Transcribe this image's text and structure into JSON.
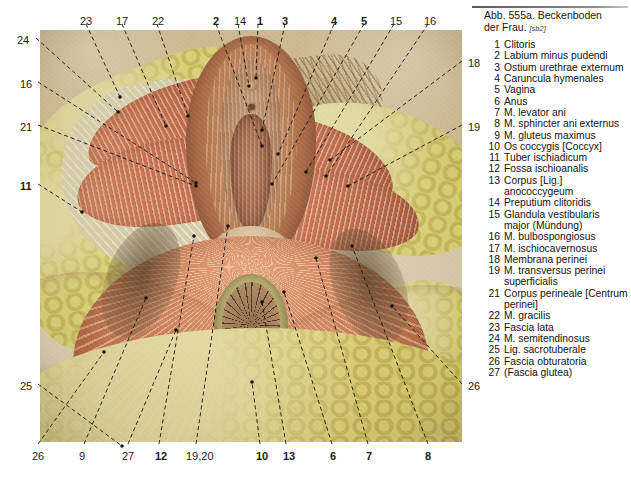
{
  "figure": {
    "title_line1": "Abb. 555a. Beckenboden",
    "title_line2": "der Frau.",
    "source": "[sb2]"
  },
  "legend": {
    "items": [
      {
        "num": "1",
        "label": "Clitoris"
      },
      {
        "num": "2",
        "label": "Labium minus pudendi"
      },
      {
        "num": "3",
        "label": "Ostium urethrae externum"
      },
      {
        "num": "4",
        "label": "Caruncula hymenales"
      },
      {
        "num": "5",
        "label": "Vagina"
      },
      {
        "num": "6",
        "label": "Anus"
      },
      {
        "num": "7",
        "label": "M. levator ani"
      },
      {
        "num": "8",
        "label": "M. sphincter ani externus"
      },
      {
        "num": "9",
        "label": "M. gluteus maximus"
      },
      {
        "num": "10",
        "label": "Os coccygis [Coccyx]"
      },
      {
        "num": "11",
        "label": "Tuber ischiadicum"
      },
      {
        "num": "12",
        "label": "Fossa ischioanalis"
      },
      {
        "num": "13",
        "label": "Corpus [Lig.] anococcygeum"
      },
      {
        "num": "14",
        "label": "Preputium clitoridis"
      },
      {
        "num": "15",
        "label": "Glandula vestibularis major (Mündung)"
      },
      {
        "num": "16",
        "label": "M. bulbospongiosus"
      },
      {
        "num": "17",
        "label": "M. ischiocavernosus"
      },
      {
        "num": "18",
        "label": "Membrana perinei"
      },
      {
        "num": "19",
        "label": "M. transversus perinei superficialis"
      },
      {
        "num": "21",
        "label": "Corpus perineale [Centrum perinei]"
      },
      {
        "num": "22",
        "label": "M. gracilis"
      },
      {
        "num": "23",
        "label": "Fascia lata"
      },
      {
        "num": "24",
        "label": "M. semitendinosus"
      },
      {
        "num": "25",
        "label": "Lig. sacrotuberale"
      },
      {
        "num": "26",
        "label": "Fascia obturatoria"
      },
      {
        "num": "27",
        "label": "(Fascia glutea)"
      }
    ]
  },
  "callouts": {
    "top": [
      {
        "text": "23",
        "bold": false,
        "x": 80,
        "y": 16
      },
      {
        "text": "17",
        "bold": false,
        "x": 116,
        "y": 16
      },
      {
        "text": "22",
        "bold": false,
        "x": 152,
        "y": 16
      },
      {
        "text": "2",
        "bold": true,
        "x": 213,
        "y": 16
      },
      {
        "text": "14",
        "bold": false,
        "x": 234,
        "y": 16
      },
      {
        "text": "1",
        "bold": true,
        "x": 257,
        "y": 16
      },
      {
        "text": "3",
        "bold": true,
        "x": 282,
        "y": 16
      },
      {
        "text": "4",
        "bold": true,
        "x": 331,
        "y": 16
      },
      {
        "text": "5",
        "bold": true,
        "x": 361,
        "y": 16
      },
      {
        "text": "15",
        "bold": false,
        "x": 390,
        "y": 16
      },
      {
        "text": "16",
        "bold": false,
        "x": 424,
        "y": 16
      }
    ],
    "bottom": [
      {
        "text": "26",
        "bold": false,
        "x": 32,
        "y": 451
      },
      {
        "text": "9",
        "bold": false,
        "x": 79,
        "y": 451
      },
      {
        "text": "27",
        "bold": false,
        "x": 122,
        "y": 451
      },
      {
        "text": "12",
        "bold": true,
        "x": 155,
        "y": 451
      },
      {
        "text": "19,20",
        "bold": false,
        "x": 186,
        "y": 451
      },
      {
        "text": "10",
        "bold": true,
        "x": 256,
        "y": 451
      },
      {
        "text": "13",
        "bold": true,
        "x": 283,
        "y": 451
      },
      {
        "text": "6",
        "bold": true,
        "x": 330,
        "y": 451
      },
      {
        "text": "7",
        "bold": true,
        "x": 366,
        "y": 451
      },
      {
        "text": "8",
        "bold": true,
        "x": 425,
        "y": 451
      }
    ],
    "left": [
      {
        "text": "24",
        "bold": false,
        "x": 17,
        "y": 35
      },
      {
        "text": "16",
        "bold": false,
        "x": 20,
        "y": 79
      },
      {
        "text": "21",
        "bold": false,
        "x": 20,
        "y": 122
      },
      {
        "text": "11",
        "bold": true,
        "x": 20,
        "y": 181
      },
      {
        "text": "25",
        "bold": false,
        "x": 20,
        "y": 381
      }
    ],
    "right": [
      {
        "text": "18",
        "bold": false,
        "x": 468,
        "y": 58
      },
      {
        "text": "19",
        "bold": false,
        "x": 468,
        "y": 122
      },
      {
        "text": "26",
        "bold": false,
        "x": 468,
        "y": 381
      }
    ]
  },
  "leader_lines": [
    {
      "name": "leader-24",
      "x1": 36,
      "y1": 38,
      "x2": 118,
      "y2": 112
    },
    {
      "name": "leader-16l",
      "x1": 38,
      "y1": 82,
      "x2": 196,
      "y2": 183
    },
    {
      "name": "leader-21",
      "x1": 38,
      "y1": 125,
      "x2": 196,
      "y2": 186
    },
    {
      "name": "leader-11",
      "x1": 38,
      "y1": 184,
      "x2": 82,
      "y2": 212
    },
    {
      "name": "leader-25",
      "x1": 38,
      "y1": 384,
      "x2": 122,
      "y2": 446
    },
    {
      "name": "leader-23",
      "x1": 86,
      "y1": 24,
      "x2": 120,
      "y2": 97
    },
    {
      "name": "leader-17",
      "x1": 122,
      "y1": 24,
      "x2": 166,
      "y2": 126
    },
    {
      "name": "leader-22",
      "x1": 157,
      "y1": 24,
      "x2": 188,
      "y2": 116
    },
    {
      "name": "leader-2",
      "x1": 216,
      "y1": 24,
      "x2": 262,
      "y2": 146
    },
    {
      "name": "leader-14",
      "x1": 238,
      "y1": 24,
      "x2": 249,
      "y2": 86
    },
    {
      "name": "leader-1",
      "x1": 258,
      "y1": 24,
      "x2": 256,
      "y2": 78
    },
    {
      "name": "leader-3",
      "x1": 285,
      "y1": 24,
      "x2": 262,
      "y2": 130
    },
    {
      "name": "leader-4",
      "x1": 334,
      "y1": 24,
      "x2": 278,
      "y2": 154
    },
    {
      "name": "leader-5",
      "x1": 364,
      "y1": 24,
      "x2": 272,
      "y2": 184
    },
    {
      "name": "leader-15",
      "x1": 394,
      "y1": 24,
      "x2": 306,
      "y2": 172
    },
    {
      "name": "leader-16r",
      "x1": 428,
      "y1": 24,
      "x2": 326,
      "y2": 176
    },
    {
      "name": "leader-18",
      "x1": 462,
      "y1": 61,
      "x2": 330,
      "y2": 160
    },
    {
      "name": "leader-19",
      "x1": 462,
      "y1": 125,
      "x2": 348,
      "y2": 186
    },
    {
      "name": "leader-26r",
      "x1": 462,
      "y1": 384,
      "x2": 392,
      "y2": 306
    },
    {
      "name": "leader-26b",
      "x1": 38,
      "y1": 444,
      "x2": 104,
      "y2": 352
    },
    {
      "name": "leader-9",
      "x1": 84,
      "y1": 444,
      "x2": 146,
      "y2": 298
    },
    {
      "name": "leader-27",
      "x1": 128,
      "y1": 444,
      "x2": 176,
      "y2": 330
    },
    {
      "name": "leader-12",
      "x1": 159,
      "y1": 444,
      "x2": 194,
      "y2": 236
    },
    {
      "name": "leader-1920",
      "x1": 196,
      "y1": 444,
      "x2": 228,
      "y2": 226
    },
    {
      "name": "leader-10",
      "x1": 260,
      "y1": 444,
      "x2": 252,
      "y2": 382
    },
    {
      "name": "leader-13",
      "x1": 286,
      "y1": 444,
      "x2": 262,
      "y2": 302
    },
    {
      "name": "leader-6",
      "x1": 332,
      "y1": 444,
      "x2": 284,
      "y2": 292
    },
    {
      "name": "leader-7",
      "x1": 368,
      "y1": 444,
      "x2": 316,
      "y2": 258
    },
    {
      "name": "leader-8",
      "x1": 428,
      "y1": 444,
      "x2": 352,
      "y2": 246
    }
  ]
}
